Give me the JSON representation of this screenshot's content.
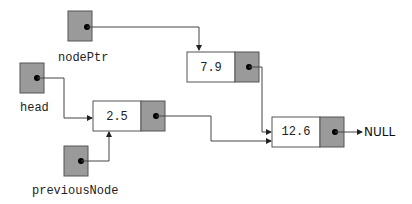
{
  "pointers": {
    "nodePtr": {
      "label": "nodePtr"
    },
    "head": {
      "label": "head"
    },
    "previousNode": {
      "label": "previousNode"
    }
  },
  "nodes": [
    {
      "id": "node-a",
      "value": "2.5"
    },
    {
      "id": "node-b",
      "value": "7.9"
    },
    {
      "id": "node-c",
      "value": "12.6"
    }
  ],
  "terminal": {
    "label": "NULL"
  },
  "colors": {
    "pointer_fill": "#9a9a9a",
    "node_value_fill": "#ffffff",
    "line": "#444444"
  }
}
